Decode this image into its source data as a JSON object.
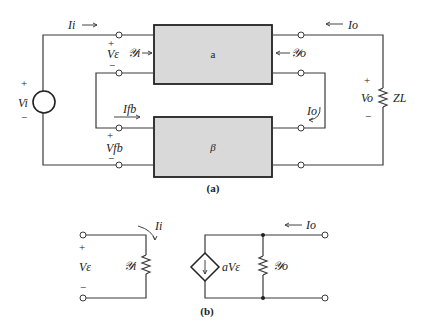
{
  "figure_a": {
    "caption": "(a)",
    "top_block_label": "a",
    "bottom_block_label": "β",
    "labels": {
      "input_current": "Ii",
      "output_current_top": "Io",
      "output_current_mid": "Io",
      "feedback_current": "Ifb",
      "source_voltage": "Vi",
      "error_voltage": "Vε",
      "feedback_voltage": "Vfb",
      "output_voltage": "Vo",
      "load_impedance": "ZL",
      "input_admittance": "𝒴i",
      "output_admittance": "𝒴o",
      "plus": "+",
      "minus": "−"
    }
  },
  "figure_b": {
    "caption": "(b)",
    "labels": {
      "input_current": "Ii",
      "error_voltage": "Vε",
      "input_admittance": "𝒴i",
      "dependent_source": "aVε",
      "output_admittance": "𝒴o",
      "output_current": "Io",
      "plus": "+",
      "minus": "−"
    }
  }
}
